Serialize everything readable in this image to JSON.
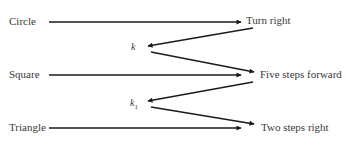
{
  "diagram": {
    "inputs": [
      {
        "label": "Circle",
        "x": 9,
        "y": 15
      },
      {
        "label": "Square",
        "x": 9,
        "y": 68
      },
      {
        "label": "Triangle",
        "x": 9,
        "y": 121
      }
    ],
    "outputs": [
      {
        "label": "Turn right",
        "x": 246,
        "y": 14
      },
      {
        "label": "Five steps forward",
        "x": 260,
        "y": 68
      },
      {
        "label": "Two steps right",
        "x": 261,
        "y": 121
      }
    ],
    "keys": [
      {
        "label": "k",
        "sub": "",
        "x": 131,
        "y": 41
      },
      {
        "label": "k",
        "sub": "1",
        "x": 130,
        "y": 97
      }
    ],
    "arrows": [
      {
        "from": [
          49,
          22
        ],
        "to": [
          241,
          22
        ]
      },
      {
        "from": [
          253,
          28
        ],
        "to": [
          148,
          46
        ]
      },
      {
        "from": [
          151,
          52
        ],
        "to": [
          254,
          72
        ]
      },
      {
        "from": [
          49,
          75
        ],
        "to": [
          241,
          75
        ]
      },
      {
        "from": [
          253,
          82
        ],
        "to": [
          148,
          101
        ]
      },
      {
        "from": [
          151,
          107
        ],
        "to": [
          254,
          124
        ]
      },
      {
        "from": [
          49,
          128
        ],
        "to": [
          241,
          128
        ]
      }
    ],
    "colors": {
      "line": "#1a1a1a",
      "text": "#3a3a3a"
    }
  }
}
